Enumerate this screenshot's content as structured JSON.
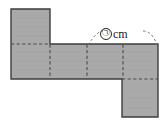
{
  "figure": {
    "type": "geometry-net",
    "background_color": "#ffffff",
    "face_fill_color": "#a9a9a9",
    "outline_color": "#3d3d3d",
    "fold_line_color": "#4a4a4a",
    "leader_line_color": "#6b6b6b",
    "label_text_color": "#1a1a1a"
  },
  "annotation": {
    "symbol": "㉠",
    "unit": "cm",
    "full_label": "㉠ cm",
    "describes": "length of the top edge spanning faces 3 and 4 of the middle row"
  },
  "net_geometry": {
    "units": "pixels",
    "middle_row": {
      "x": 11,
      "y": 44,
      "width": 147,
      "height": 35,
      "cell_count": 4,
      "cell_divider_x": [
        50,
        87,
        123
      ]
    },
    "top_flap": {
      "x": 11,
      "y": 9,
      "width": 39,
      "height": 35
    },
    "bottom_flap": {
      "x": 122,
      "y": 79,
      "width": 36,
      "height": 38
    },
    "fold_lines": [
      {
        "orientation": "horizontal",
        "x1": 11,
        "y1": 44,
        "x2": 50,
        "y2": 44
      },
      {
        "orientation": "horizontal",
        "x1": 122,
        "y1": 79,
        "x2": 158,
        "y2": 79
      },
      {
        "orientation": "vertical",
        "x1": 50,
        "y1": 44,
        "x2": 50,
        "y2": 79
      },
      {
        "orientation": "vertical",
        "x1": 87,
        "y1": 44,
        "x2": 87,
        "y2": 79
      },
      {
        "orientation": "vertical",
        "x1": 123,
        "y1": 44,
        "x2": 123,
        "y2": 79
      }
    ],
    "leader_arc": {
      "from_x": 88,
      "from_y": 45,
      "peak_y": 30,
      "to_x": 157,
      "to_y": 45
    }
  }
}
